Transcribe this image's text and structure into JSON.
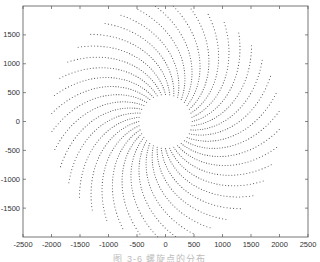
{
  "chart_data": {
    "type": "scatter",
    "title": "",
    "xlabel": "",
    "ylabel": "",
    "xlim": [
      -2500,
      2500
    ],
    "ylim": [
      -2000,
      2000
    ],
    "xticks": [
      -2500,
      -2000,
      -1500,
      -1000,
      -500,
      0,
      500,
      1000,
      1500,
      2000,
      2500
    ],
    "yticks": [
      -1500,
      -1000,
      -500,
      0,
      500,
      1000,
      1500
    ],
    "xtick_labels": [
      "-2500",
      "-2000",
      "-1500",
      "-1000",
      "-500",
      "0",
      "500",
      "1000",
      "1500",
      "2000",
      "2500"
    ],
    "ytick_labels": [
      "-1500",
      "-1000",
      "-500",
      "0",
      "500",
      "1000",
      "1500"
    ],
    "grid": false,
    "legend": null,
    "series": [
      {
        "name": "spiral points",
        "description": "Spiral pattern of point markers: ~40 curved arms radiating from an empty central disk",
        "arms": 40,
        "points_per_arm": 40,
        "inner_radius": 470,
        "outer_radius": 2000,
        "twist_degrees": 50,
        "marker": ".",
        "color": "#555555"
      }
    ],
    "caption": "图 3-6  螺旋点的分布"
  },
  "figure": {
    "caption": "图 3-6  螺旋点的分布",
    "axes_color": "#555555",
    "marker_color": "#555555"
  }
}
